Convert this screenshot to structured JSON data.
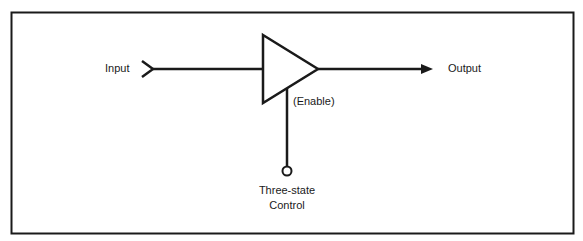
{
  "diagram": {
    "type": "three-state buffer",
    "labels": {
      "input": "Input",
      "output": "Output",
      "enable": "(Enable)",
      "control_line1": "Three-state",
      "control_line2": "Control"
    },
    "colors": {
      "stroke": "#1a1a1a",
      "background": "#ffffff"
    }
  }
}
